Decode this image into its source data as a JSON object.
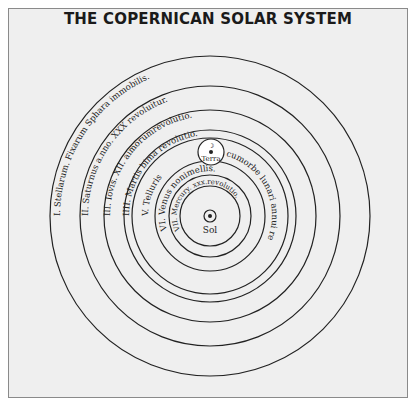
{
  "title": "THE COPERNICAN SOLAR SYSTEM",
  "center_label": "Sol",
  "earth_label": "Terra",
  "moon_label": "☽",
  "orbits": [
    {
      "id": "stars",
      "label": "I. Stellarum. Fixarum Sphara immobilis."
    },
    {
      "id": "saturn",
      "label": "II. Saturnus a.nno. XXX revoluitur."
    },
    {
      "id": "jupiter",
      "label": "III. Iovis. XII. aimorumrevolutio."
    },
    {
      "id": "mars",
      "label": "IIII. Martis bima revolutio."
    },
    {
      "id": "earth",
      "label": "V. Telluris",
      "label_right": "cumorbe lunari annui revolutio."
    },
    {
      "id": "venus",
      "label": "VI. Venus nonimellis."
    },
    {
      "id": "mercury",
      "label": "VII. Mercury. xxx.revolutio."
    }
  ],
  "colors": {
    "line": "#222222",
    "background": "#efefef",
    "border": "#8a8a8a"
  }
}
